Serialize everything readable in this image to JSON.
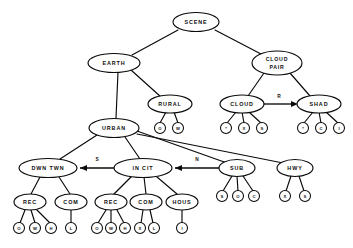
{
  "diagram": {
    "title": "SCENE",
    "type": "hierarchical-semantic-network",
    "nodes": {
      "scene": {
        "label": "SCENE",
        "cx": 196,
        "cy": 22,
        "rx": 23,
        "ry": 9.5
      },
      "earth": {
        "label": "EARTH",
        "cx": 114,
        "cy": 63,
        "rx": 26,
        "ry": 9.5
      },
      "cloud_pair": {
        "label1": "CLOUD",
        "label2": "PAIR",
        "cx": 277,
        "cy": 63,
        "rx": 25,
        "ry": 12
      },
      "rural": {
        "label": "RURAL",
        "cx": 170,
        "cy": 104,
        "rx": 22,
        "ry": 9
      },
      "cloud": {
        "label": "CLOUD",
        "cx": 242,
        "cy": 104,
        "rx": 22,
        "ry": 9
      },
      "shad": {
        "label": "SHAD",
        "cx": 319,
        "cy": 104,
        "rx": 22,
        "ry": 9
      },
      "urban": {
        "label": "URBAN",
        "cx": 114,
        "cy": 128,
        "rx": 25,
        "ry": 9.5
      },
      "dwn_twn": {
        "label": "DWN TWN",
        "cx": 48,
        "cy": 168,
        "rx": 29,
        "ry": 9.5
      },
      "in_cit": {
        "label": "IN CIT",
        "cx": 143,
        "cy": 168,
        "rx": 29,
        "ry": 9.5
      },
      "sub": {
        "label": "SUB",
        "cx": 237,
        "cy": 168,
        "rx": 18,
        "ry": 8.5
      },
      "hwy": {
        "label": "HWY",
        "cx": 295,
        "cy": 168,
        "rx": 18,
        "ry": 8.5
      },
      "rec_d": {
        "label": "REC",
        "cx": 30,
        "cy": 202,
        "rx": 16,
        "ry": 8
      },
      "com_d": {
        "label": "COM",
        "cx": 71,
        "cy": 202,
        "rx": 16,
        "ry": 8
      },
      "rec_i": {
        "label": "REC",
        "cx": 111,
        "cy": 202,
        "rx": 16,
        "ry": 8
      },
      "com_i": {
        "label": "COM",
        "cx": 146,
        "cy": 202,
        "rx": 16,
        "ry": 8
      },
      "hous": {
        "label": "HOUS",
        "cx": 182,
        "cy": 202,
        "rx": 16,
        "ry": 8
      }
    },
    "leaves": [
      {
        "parent": "rural",
        "label": "O",
        "cx": 160,
        "cy": 128,
        "r": 5.5
      },
      {
        "parent": "rural",
        "label": "W",
        "cx": 178,
        "cy": 128,
        "r": 5.5
      },
      {
        "parent": "cloud",
        "label": "*",
        "cx": 226,
        "cy": 128,
        "r": 5.5
      },
      {
        "parent": "cloud",
        "label": "X",
        "cx": 244,
        "cy": 128,
        "r": 5.5
      },
      {
        "parent": "cloud",
        "label": "S",
        "cx": 262,
        "cy": 128,
        "r": 5.5
      },
      {
        "parent": "shad",
        "label": "*",
        "cx": 303,
        "cy": 128,
        "r": 5.5
      },
      {
        "parent": "shad",
        "label": "C",
        "cx": 321,
        "cy": 128,
        "r": 5.5
      },
      {
        "parent": "shad",
        "label": "I",
        "cx": 339,
        "cy": 128,
        "r": 5.5
      },
      {
        "parent": "sub",
        "label": "S",
        "cx": 222,
        "cy": 196,
        "r": 5.5
      },
      {
        "parent": "sub",
        "label": "O",
        "cx": 238,
        "cy": 196,
        "r": 5.5
      },
      {
        "parent": "sub",
        "label": "C",
        "cx": 254,
        "cy": 196,
        "r": 5.5
      },
      {
        "parent": "hwy",
        "label": "X",
        "cx": 285,
        "cy": 196,
        "r": 5.5
      },
      {
        "parent": "hwy",
        "label": "S",
        "cx": 305,
        "cy": 196,
        "r": 5.5
      },
      {
        "parent": "rec_d",
        "label": "O",
        "cx": 19,
        "cy": 228,
        "r": 5.5
      },
      {
        "parent": "rec_d",
        "label": "W",
        "cx": 35,
        "cy": 228,
        "r": 5.5
      },
      {
        "parent": "rec_d",
        "label": "H",
        "cx": 51,
        "cy": 228,
        "r": 5.5
      },
      {
        "parent": "com_d",
        "label": "L",
        "cx": 71,
        "cy": 228,
        "r": 5.5
      },
      {
        "parent": "rec_i",
        "label": "O",
        "cx": 97,
        "cy": 228,
        "r": 5.5
      },
      {
        "parent": "rec_i",
        "label": "W",
        "cx": 111,
        "cy": 228,
        "r": 5.5
      },
      {
        "parent": "rec_i",
        "label": "H",
        "cx": 125,
        "cy": 228,
        "r": 5.5
      },
      {
        "parent": "com_i",
        "label": "X",
        "cx": 140,
        "cy": 228,
        "r": 5.5
      },
      {
        "parent": "com_i",
        "label": "L",
        "cx": 154,
        "cy": 228,
        "r": 5.5
      },
      {
        "parent": "hous",
        "label": "I",
        "cx": 182,
        "cy": 228,
        "r": 5.5
      }
    ],
    "edge_labels": {
      "south": "S",
      "north": "N",
      "right": "R"
    }
  }
}
